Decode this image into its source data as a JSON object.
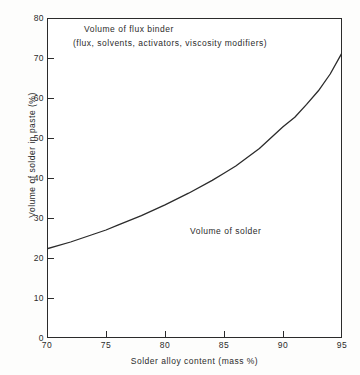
{
  "chart_data": {
    "type": "line",
    "title": "",
    "xlabel": "Solder alloy content (mass %)",
    "ylabel": "Volume of solder in paste (%)",
    "xlim": [
      70,
      95
    ],
    "ylim": [
      0,
      80
    ],
    "xticks": [
      "70",
      "75",
      "80",
      "85",
      "90",
      "95"
    ],
    "yticks": [
      "0",
      "10",
      "20",
      "30",
      "40",
      "50",
      "60",
      "70",
      "80"
    ],
    "grid": false,
    "legend": "none",
    "series": [
      {
        "name": "Volume of solder in paste",
        "x": [
          70,
          72,
          74,
          75,
          76,
          78,
          80,
          82,
          84,
          85,
          86,
          88,
          90,
          91,
          92,
          93,
          94,
          95
        ],
        "values": [
          22.3,
          24.0,
          26.0,
          27.0,
          28.2,
          30.6,
          33.3,
          36.2,
          39.4,
          41.2,
          43.0,
          47.4,
          52.8,
          55.2,
          58.4,
          61.8,
          66.0,
          71.3
        ]
      }
    ],
    "annotations": [
      {
        "text": "Volume of flux binder",
        "x": 76.5,
        "y": 77.5
      },
      {
        "text": "(flux, solvents, activators, viscosity modifiers)",
        "x": 75.4,
        "y": 74.0
      },
      {
        "text": "Volume of solder",
        "x": 82.5,
        "y": 28.5
      }
    ],
    "colors": {
      "line": "#2b2b2b",
      "axis": "#2b2b2b",
      "background": "#ffffff"
    }
  },
  "axes": {
    "y_ticks": [
      {
        "label": "80",
        "value": 80
      },
      {
        "label": "70",
        "value": 70
      },
      {
        "label": "60",
        "value": 60
      },
      {
        "label": "50",
        "value": 50
      },
      {
        "label": "40",
        "value": 40
      },
      {
        "label": "30",
        "value": 30
      },
      {
        "label": "20",
        "value": 20
      },
      {
        "label": "10",
        "value": 10
      },
      {
        "label": "0",
        "value": 0
      }
    ],
    "x_ticks": [
      {
        "label": "70",
        "value": 70
      },
      {
        "label": "75",
        "value": 75
      },
      {
        "label": "80",
        "value": 80
      },
      {
        "label": "85",
        "value": 85
      },
      {
        "label": "90",
        "value": 90
      },
      {
        "label": "95",
        "value": 95
      }
    ],
    "y_title": "Volume of solder in paste (%)",
    "x_title": "Solder alloy content (mass %)"
  },
  "annotations": {
    "flux_line1": "Volume of flux binder",
    "flux_line2": "(flux, solvents, activators, viscosity modifiers)",
    "solder": "Volume of solder"
  }
}
